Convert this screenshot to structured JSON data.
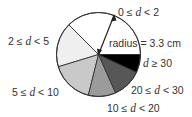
{
  "chart_data": {
    "type": "pie",
    "title": "",
    "annotation": "radius = 3.3 cm",
    "radius_cm": 3.3,
    "start_angle_deg": 0,
    "direction": "counterclockwise",
    "legend": "none (direct labels)",
    "categories": [
      "0 ≤ d < 2",
      "2 ≤ d < 5",
      "5 ≤ d < 10",
      "10 ≤ d < 20",
      "20 ≤ d < 30",
      "d ≥ 30"
    ],
    "angles_deg": [
      135,
      62,
      59,
      38,
      41,
      25
    ],
    "values": [
      37.5,
      17.2,
      16.4,
      10.6,
      11.4,
      6.9
    ],
    "value_unit": "percent (estimated from slice angles)",
    "colors": [
      "#ffffff",
      "#efefef",
      "#c9c9c9",
      "#9b9b9b",
      "#575757",
      "#000000"
    ]
  },
  "labels": {
    "slice_0": {
      "pre": "0 ≤ ",
      "var": "d",
      "post": " < 2"
    },
    "slice_1": {
      "pre": "2 ≤ ",
      "var": "d",
      "post": " < 5"
    },
    "slice_2": {
      "pre": "5 ≤ ",
      "var": "d",
      "post": " < 10"
    },
    "slice_3": {
      "pre": "10 ≤ ",
      "var": "d",
      "post": " < 20"
    },
    "slice_4": {
      "pre": "20 ≤ ",
      "var": "d",
      "post": " < 30"
    },
    "slice_5": {
      "pre": "",
      "var": "d",
      "post": " ≥ 30"
    },
    "radius": "radius = 3.3 cm"
  },
  "geometry": {
    "cx": 98.5,
    "cy": 54.5,
    "r": 42
  }
}
